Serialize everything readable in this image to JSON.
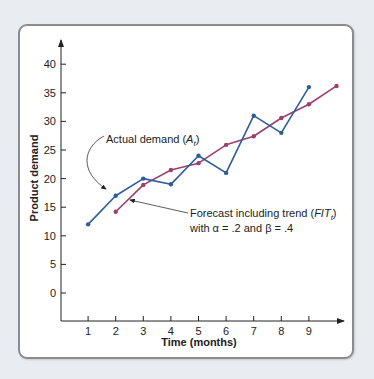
{
  "chart_data": {
    "type": "line",
    "title": "",
    "xlabel": "Time (months)",
    "ylabel": "Product demand",
    "x_ticks": [
      1,
      2,
      3,
      4,
      5,
      6,
      7,
      8,
      9
    ],
    "y_ticks": [
      0,
      5,
      10,
      15,
      20,
      25,
      30,
      35,
      40
    ],
    "xlim": [
      0,
      10
    ],
    "ylim": [
      -5,
      45
    ],
    "grid": false,
    "legend": "none (inline annotations)",
    "series": [
      {
        "name": "Actual demand (A_t)",
        "color": "#2c5d9c",
        "x": [
          1,
          2,
          3,
          4,
          5,
          6,
          7,
          8,
          9
        ],
        "values": [
          12,
          17,
          20,
          19,
          24,
          21,
          31,
          28,
          36
        ]
      },
      {
        "name": "Forecast including trend (FIT_t) with α = .2 and β = .4",
        "color": "#9c3f6e",
        "x": [
          2,
          3,
          4,
          5,
          6,
          7,
          8,
          9,
          10
        ],
        "values": [
          14.2,
          18.9,
          21.5,
          22.7,
          25.9,
          27.4,
          30.6,
          33.0,
          36.2
        ]
      }
    ],
    "annotations": [
      {
        "text_main": "Actual demand (",
        "text_italic": "A",
        "text_sub": "t",
        "text_close": ")"
      },
      {
        "text_main": "Forecast including trend (",
        "text_italic": "FIT",
        "text_sub": "t",
        "text_close": ")",
        "line2": "with α = .2 and β = .4"
      }
    ]
  },
  "labels": {
    "xlabel": "Time (months)",
    "ylabel": "Product demand",
    "actual_main": "Actual demand (",
    "actual_italic": "A",
    "actual_sub": "t",
    "actual_close": ")",
    "forecast_main": "Forecast including trend (",
    "forecast_italic": "FIT",
    "forecast_sub": "t",
    "forecast_close": ")",
    "forecast_line2": "with α = .2 and β = .4"
  },
  "colors": {
    "actual": "#2c5d9c",
    "forecast": "#9c3f6e",
    "axis": "#222222",
    "background": "#e9edf1",
    "panel_border": "#8a8d90"
  }
}
